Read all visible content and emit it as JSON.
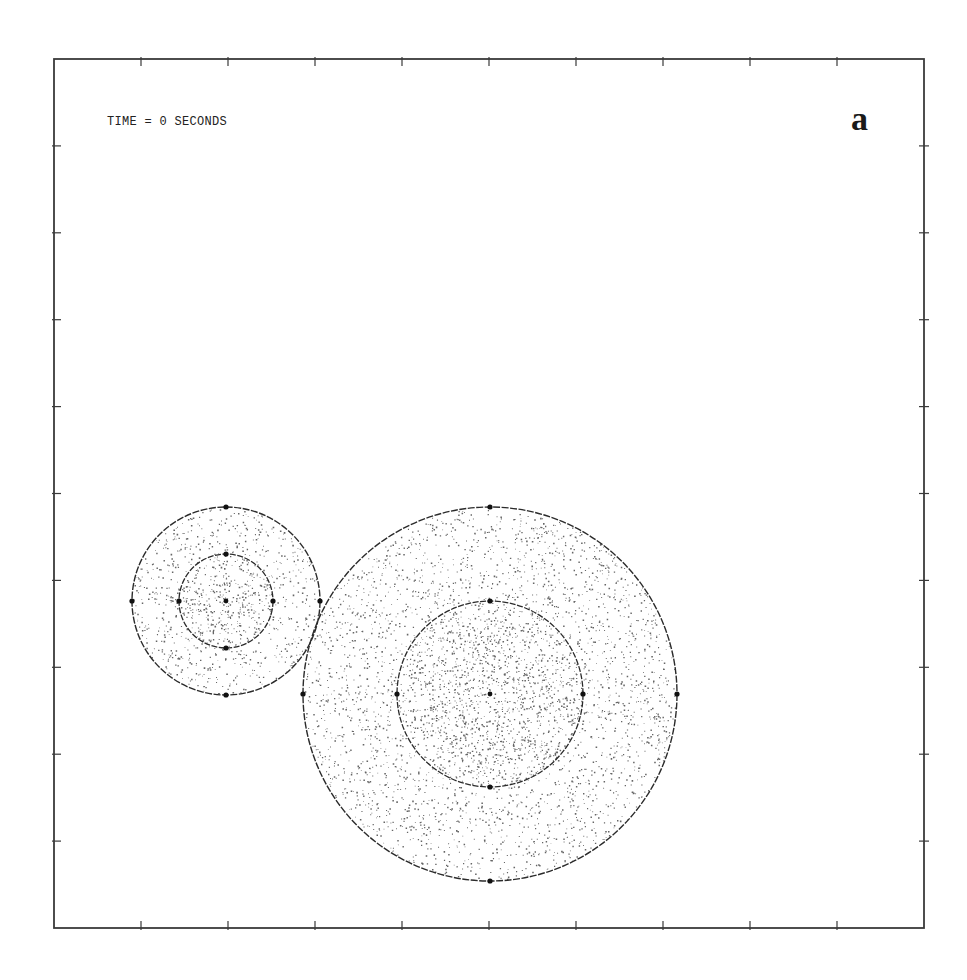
{
  "figure": {
    "time_label": "TIME = 0 SECONDS",
    "panel_label": "a",
    "frame": {
      "left": 54,
      "top": 59,
      "right": 924,
      "bottom": 928
    },
    "ticks_per_side": 9,
    "colors": {
      "frame": "#3a3a3a",
      "particles": "#333333",
      "outline": "#2b2b2b",
      "markers": "#111111",
      "background": "#ffffff"
    }
  },
  "chart_data": {
    "type": "scatter",
    "title": "TIME = 0 SECONDS",
    "panel": "a",
    "xlabel": "",
    "ylabel": "",
    "grid": false,
    "legend": null,
    "axis_ticks": {
      "x": [
        "",
        "",
        "",
        "",
        "",
        "",
        "",
        "",
        ""
      ],
      "y": [
        "",
        "",
        "",
        "",
        "",
        "",
        "",
        "",
        ""
      ],
      "count_per_side": 9,
      "spacing_fraction": 0.1
    },
    "xlim": [
      0,
      10
    ],
    "ylim": [
      0,
      10
    ],
    "bodies": [
      {
        "name": "small body",
        "center_px": [
          226,
          601
        ],
        "center_axes": [
          2.0,
          3.8
        ],
        "outer_radius_px": 94,
        "inner_radius_px": 47,
        "outer_radius_axes": 1.08,
        "inner_radius_axes": 0.54,
        "core_particles": 420,
        "mantle_particles": 620,
        "marker_points": [
          "center",
          "inner-N",
          "inner-S",
          "inner-E",
          "inner-W",
          "outer-N",
          "outer-S",
          "outer-E",
          "outer-W"
        ]
      },
      {
        "name": "large body",
        "center_px": [
          490,
          694
        ],
        "center_axes": [
          5.0,
          2.7
        ],
        "outer_radius_px": 187,
        "inner_radius_px": 93,
        "outer_radius_axes": 2.15,
        "inner_radius_axes": 1.07,
        "core_particles": 1700,
        "mantle_particles": 2500,
        "marker_points": [
          "center",
          "inner-N",
          "inner-S",
          "inner-E",
          "inner-W",
          "outer-N",
          "outer-S",
          "outer-E",
          "outer-W"
        ]
      }
    ]
  }
}
